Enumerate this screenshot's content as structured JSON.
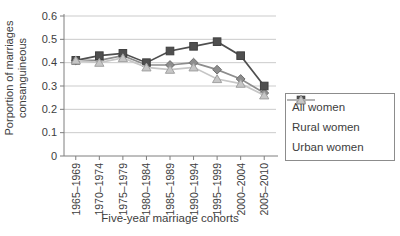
{
  "chart_data": {
    "type": "line",
    "title": "",
    "categories": [
      "1965–1969",
      "1970–1974",
      "1975–1979",
      "1980–1984",
      "1985–1989",
      "1990–1994",
      "1995–1999",
      "2000–2004",
      "2005–2010"
    ],
    "series": [
      {
        "name": "All women",
        "marker": "diamond",
        "color": "#8d8d8d",
        "marker_stroke": "#6f6f6f",
        "values": [
          0.41,
          0.41,
          0.43,
          0.39,
          0.39,
          0.4,
          0.37,
          0.33,
          0.27
        ]
      },
      {
        "name": "Rural women",
        "marker": "square",
        "color": "#4f4f4f",
        "marker_stroke": "#3f3f3f",
        "values": [
          0.41,
          0.43,
          0.44,
          0.4,
          0.45,
          0.47,
          0.49,
          0.43,
          0.3
        ]
      },
      {
        "name": "Urban women",
        "marker": "triangle",
        "color": "#c6c6c6",
        "marker_stroke": "#a0a0a0",
        "values": [
          0.41,
          0.4,
          0.42,
          0.38,
          0.37,
          0.38,
          0.33,
          0.31,
          0.26
        ]
      }
    ],
    "xlabel": "Five-year marriage cohorts",
    "ylabel": "Porportion of marriages consanguineous",
    "ylabel_lines": [
      "Porportion of marriages",
      "consanguineous"
    ],
    "ylim": [
      0,
      0.6
    ],
    "yticks": [
      0,
      0.1,
      0.2,
      0.3,
      0.4,
      0.5,
      0.6
    ],
    "ytick_labels": [
      "0",
      "0.1",
      "0.2",
      "0.3",
      "0.4",
      "0.5",
      "0.6"
    ],
    "grid": "horizontal",
    "gridline_color": "#cbcbcb",
    "axis_color": "#7e7e7e",
    "text_color": "#3d3d3d",
    "legend_position": "right-bottom",
    "legend_border_color": "#8c8c8c"
  }
}
